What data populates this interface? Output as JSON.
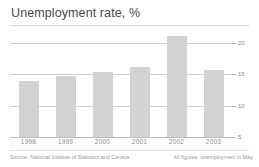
{
  "chart_data": {
    "type": "bar",
    "title": "Unemployment rate, %",
    "xlabel": "",
    "ylabel": "",
    "categories": [
      "1998",
      "1999",
      "2000",
      "2001",
      "2002",
      "2003"
    ],
    "values": [
      13.9,
      14.7,
      15.4,
      16.1,
      21.1,
      15.6
    ],
    "yticks": [
      20,
      15,
      10,
      5
    ],
    "ylim": [
      5,
      22.5
    ],
    "grid": true,
    "legend": "none",
    "bar_color": "#d2d2d2",
    "grid_color": "#cfcfcf",
    "annotations": [
      "Source: National Institute of Statistics and Census",
      "All figures: unemployment in May"
    ]
  },
  "footer": {
    "source": "Source: National Institute of Statistics and Census",
    "note": "All figures: unemployment in May"
  }
}
